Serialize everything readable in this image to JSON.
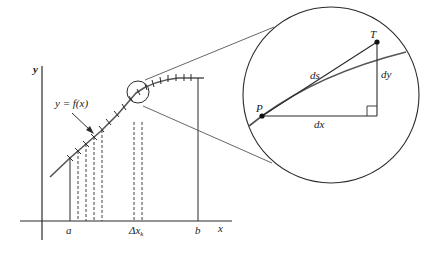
{
  "diagram": {
    "colors": {
      "stroke": "#2a2a2a",
      "curve": "#555555",
      "background": "#ffffff"
    },
    "left_plot": {
      "axis_labels": {
        "x": "x",
        "y": "y"
      },
      "function_label": "y = f(x)",
      "tick_labels": {
        "a": "a",
        "delta": "Δx",
        "delta_sub": "k",
        "b": "b"
      }
    },
    "zoom_view": {
      "points": {
        "P": "P",
        "T": "T"
      },
      "segment_labels": {
        "ds": "ds",
        "dx": "dx",
        "dy": "dy"
      }
    }
  }
}
